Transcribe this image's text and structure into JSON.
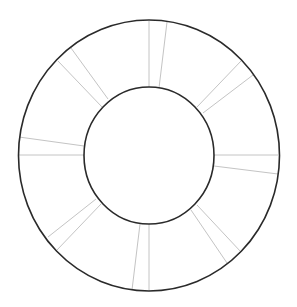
{
  "diagram": {
    "type": "annulus-wheel",
    "background": "#ffffff",
    "ring_color": "#2a2a2a",
    "divider_color": "#c4c4c4",
    "outer_ring": {
      "cx": 149,
      "cy": 155.5,
      "rx": 130.5,
      "ry": 135.5
    },
    "inner_ring": {
      "cx": 149,
      "cy": 155.5,
      "rx": 65,
      "ry": 68.5
    },
    "dividers": [
      {
        "x1": 149,
        "y1": 21,
        "x2": 149,
        "y2": 88
      },
      {
        "x1": 167,
        "y1": 22,
        "x2": 159,
        "y2": 88
      },
      {
        "x1": 241,
        "y1": 61,
        "x2": 197,
        "y2": 107
      },
      {
        "x1": 253,
        "y1": 75,
        "x2": 203,
        "y2": 113
      },
      {
        "x1": 278,
        "y1": 155,
        "x2": 214,
        "y2": 155
      },
      {
        "x1": 278,
        "y1": 174,
        "x2": 214,
        "y2": 166
      },
      {
        "x1": 241,
        "y1": 252,
        "x2": 197,
        "y2": 205
      },
      {
        "x1": 227,
        "y1": 263,
        "x2": 191,
        "y2": 210
      },
      {
        "x1": 149,
        "y1": 291,
        "x2": 149,
        "y2": 224
      },
      {
        "x1": 132,
        "y1": 290,
        "x2": 140,
        "y2": 224
      },
      {
        "x1": 57,
        "y1": 250,
        "x2": 101,
        "y2": 204
      },
      {
        "x1": 48,
        "y1": 237,
        "x2": 96,
        "y2": 199
      },
      {
        "x1": 19,
        "y1": 155,
        "x2": 84,
        "y2": 155
      },
      {
        "x1": 19,
        "y1": 137,
        "x2": 84,
        "y2": 146
      },
      {
        "x1": 58,
        "y1": 61,
        "x2": 102,
        "y2": 107
      },
      {
        "x1": 71,
        "y1": 48,
        "x2": 108,
        "y2": 99
      }
    ]
  }
}
